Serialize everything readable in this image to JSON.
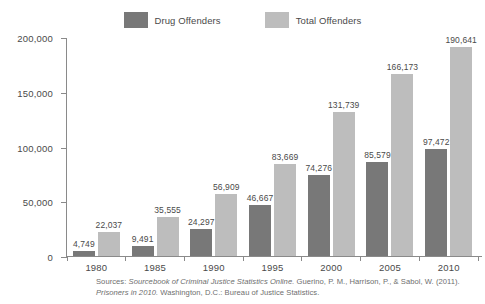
{
  "chart_data": {
    "type": "bar",
    "title": "",
    "subtitle": "",
    "xlabel": "",
    "ylabel": "",
    "categories": [
      "1980",
      "1985",
      "1990",
      "1995",
      "2000",
      "2005",
      "2010"
    ],
    "series": [
      {
        "name": "Drug Offenders",
        "color": "#787878",
        "values": [
          4749,
          9491,
          24297,
          46667,
          74276,
          85579,
          97472
        ],
        "labels": [
          "4,749",
          "9,491",
          "24,297",
          "46,667",
          "74,276",
          "85,579",
          "97,472"
        ]
      },
      {
        "name": "Total Offenders",
        "color": "#bdbdbd",
        "values": [
          22037,
          35555,
          56909,
          83669,
          131739,
          166173,
          190641
        ],
        "labels": [
          "22,037",
          "35,555",
          "56,909",
          "83,669",
          "131,739",
          "166,173",
          "190,641"
        ]
      }
    ],
    "ylim": [
      0,
      200000
    ],
    "yticks": [
      0,
      50000,
      100000,
      150000,
      200000
    ],
    "ytick_labels": [
      "0",
      "50,000",
      "100,000",
      "150,000",
      "200,000"
    ],
    "grid": false,
    "legend_position": "top-center"
  },
  "legend": {
    "items": [
      {
        "label": "Drug Offenders",
        "color": "#787878"
      },
      {
        "label": "Total Offenders",
        "color": "#bdbdbd"
      }
    ]
  },
  "source": {
    "prefix": "Sources: ",
    "italic_part": "Sourcebook of Criminal Justice Statistics Online.",
    "line1_rest": " Guerino, P. M., Harrison, P., & Sabol, W. (2011).",
    "italic_part2": "Prisoners in 2010.",
    "line2_rest": " Washington, D.C.: Bureau of Justice Statistics."
  }
}
